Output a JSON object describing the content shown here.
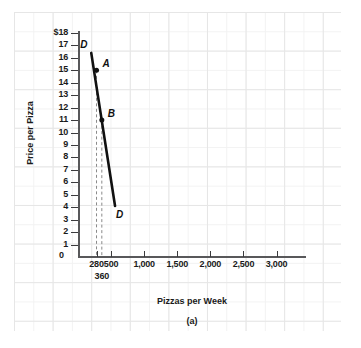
{
  "chart_data": {
    "type": "line",
    "title": "",
    "caption": "(a)",
    "xlabel": "Pizzas per Week",
    "ylabel": "Price per Pizza",
    "xlim": [
      0,
      3400
    ],
    "ylim": [
      0,
      18
    ],
    "grid": true,
    "legend": "none",
    "x_ticks": [
      {
        "value": 280,
        "label": "280",
        "row": 1
      },
      {
        "value": 360,
        "label": "360",
        "row": 2
      },
      {
        "value": 500,
        "label": "500",
        "row": 1
      },
      {
        "value": 1000,
        "label": "1,000",
        "row": 1
      },
      {
        "value": 1500,
        "label": "1,500",
        "row": 1
      },
      {
        "value": 2000,
        "label": "2,000",
        "row": 1
      },
      {
        "value": 2500,
        "label": "2,500",
        "row": 1
      },
      {
        "value": 3000,
        "label": "3,000",
        "row": 1
      }
    ],
    "y_ticks": [
      {
        "value": 18,
        "label": "$18"
      },
      {
        "value": 17,
        "label": "17"
      },
      {
        "value": 16,
        "label": "16"
      },
      {
        "value": 15,
        "label": "15"
      },
      {
        "value": 14,
        "label": "14"
      },
      {
        "value": 13,
        "label": "13"
      },
      {
        "value": 12,
        "label": "12"
      },
      {
        "value": 11,
        "label": "11"
      },
      {
        "value": 10,
        "label": "10"
      },
      {
        "value": 9,
        "label": "9"
      },
      {
        "value": 8,
        "label": "8"
      },
      {
        "value": 7,
        "label": "7"
      },
      {
        "value": 6,
        "label": "6"
      },
      {
        "value": 5,
        "label": "5"
      },
      {
        "value": 4,
        "label": "4"
      },
      {
        "value": 3,
        "label": "3"
      },
      {
        "value": 2,
        "label": "2"
      },
      {
        "value": 1,
        "label": "1"
      },
      {
        "value": 0,
        "label": "0"
      }
    ],
    "zero_label": "0",
    "series": [
      {
        "name": "D",
        "kind": "demand-curve",
        "label_top": "D",
        "label_bottom": "D",
        "color": "#111111",
        "x": [
          200,
          560
        ],
        "y": [
          16.4,
          4.1
        ]
      }
    ],
    "points": [
      {
        "label": "A",
        "x": 280,
        "y": 15
      },
      {
        "label": "B",
        "x": 360,
        "y": 11
      }
    ],
    "dropline_color": "#8a8a8a",
    "axis_color": "#58585a",
    "grid_color": "#e6e6e6"
  }
}
